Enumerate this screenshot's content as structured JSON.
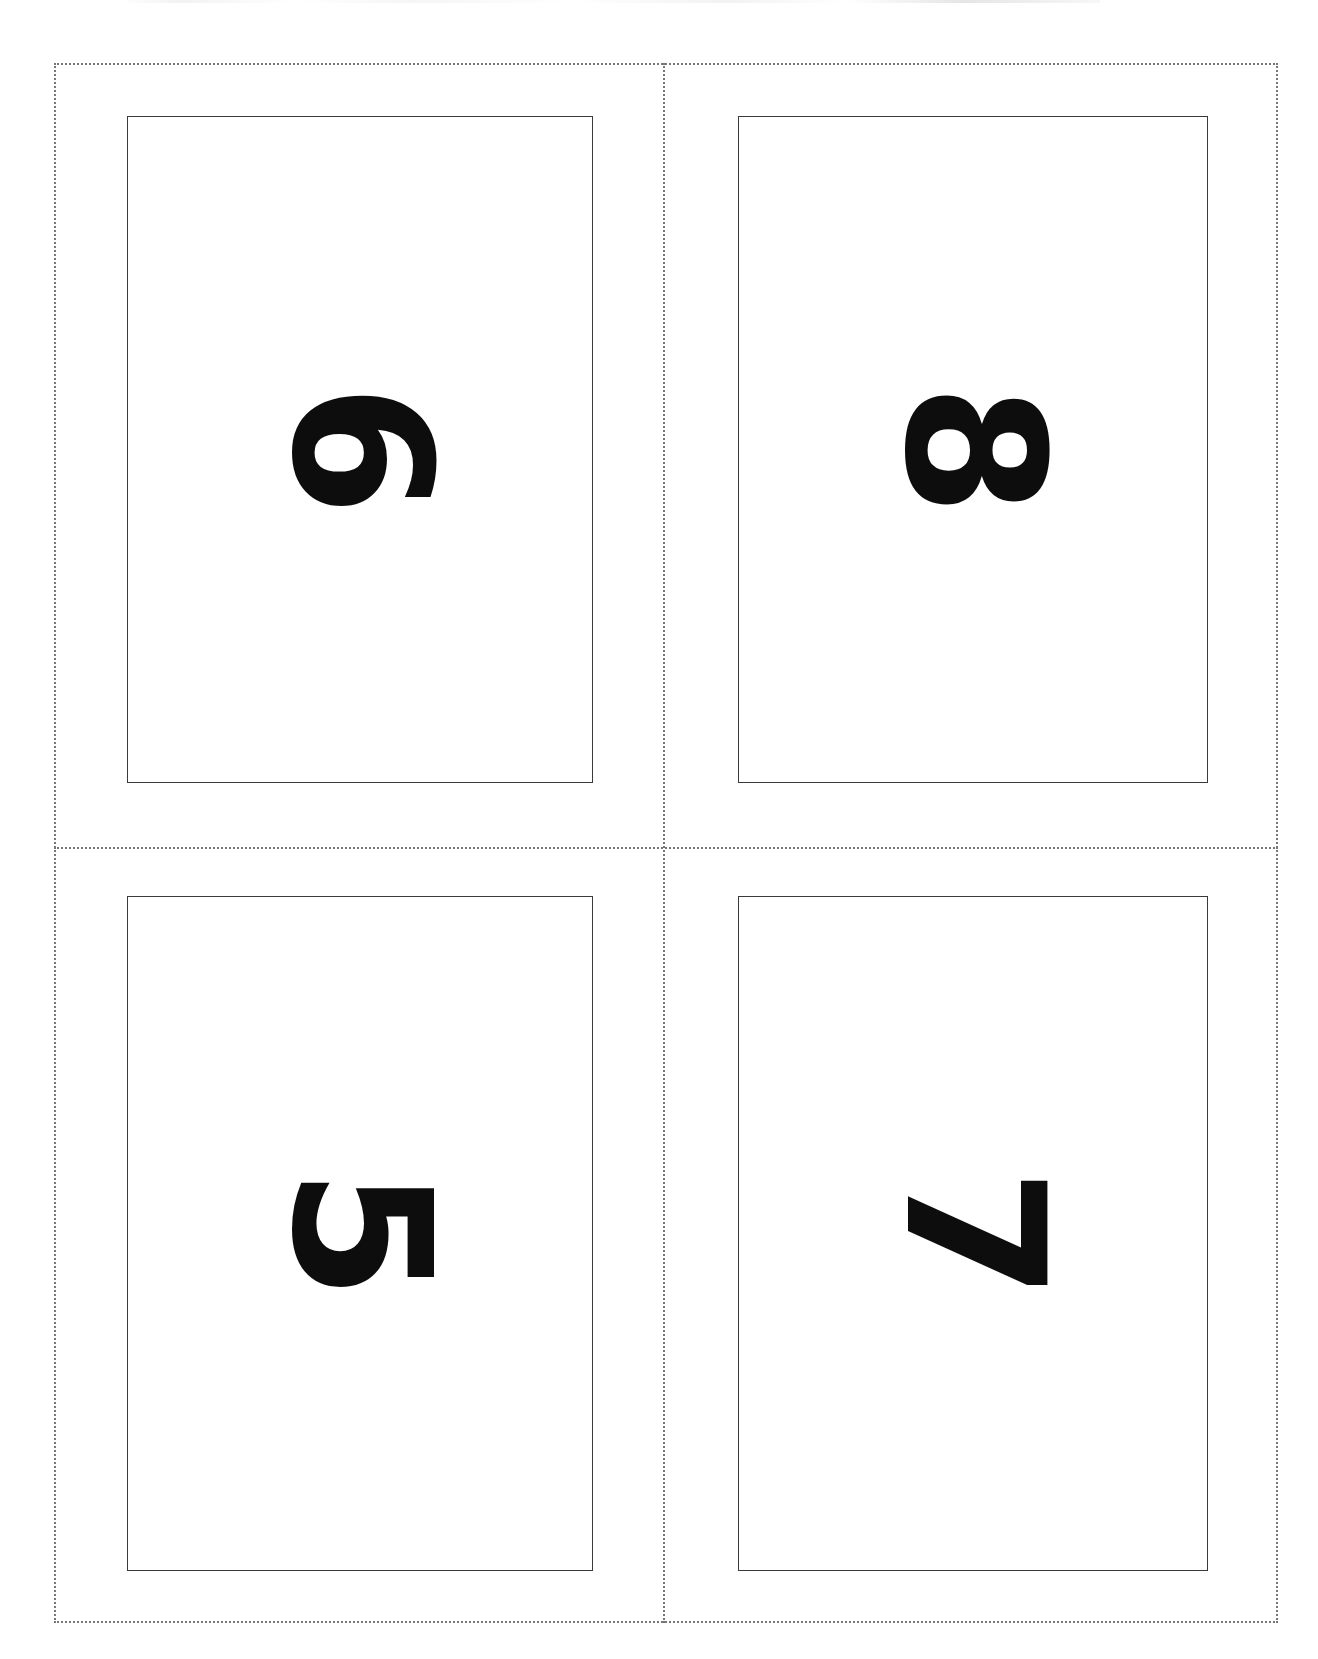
{
  "document": {
    "type": "printable-flashcard-sheet",
    "title": "Number Flashcards",
    "orientation": "portrait",
    "card_rotation_degrees": 90,
    "background_color": "#ffffff",
    "ink_color": "#0d0d0d",
    "guide_color": "#777777",
    "card_border_color": "#3a3a3a"
  },
  "cut_guides": {
    "outer_border_style": "dotted",
    "vertical_divider_style": "dotted",
    "horizontal_divider_style": "dotted"
  },
  "cards": [
    {
      "position": "top-left",
      "number": "6"
    },
    {
      "position": "top-right",
      "number": "8"
    },
    {
      "position": "bottom-left",
      "number": "5"
    },
    {
      "position": "bottom-right",
      "number": "7"
    }
  ]
}
